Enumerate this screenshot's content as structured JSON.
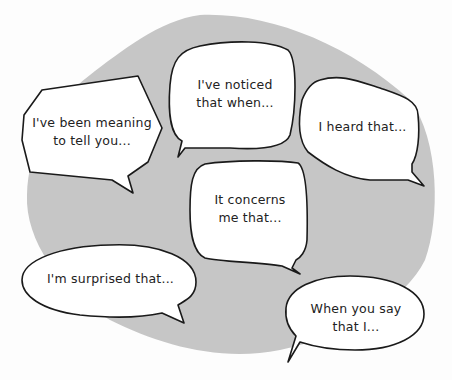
{
  "background": {
    "blob_color": "#c6c6c6",
    "page_color": "#fdfdfd",
    "outline_color": "#1a1a1a"
  },
  "bubbles": [
    {
      "id": "been-meaning",
      "text": "I've been meaning\nto tell you..."
    },
    {
      "id": "noticed",
      "text": "I've noticed\nthat when..."
    },
    {
      "id": "heard",
      "text": "I heard that..."
    },
    {
      "id": "concerns",
      "text": "It concerns\nme that..."
    },
    {
      "id": "surprised",
      "text": "I'm surprised that..."
    },
    {
      "id": "when-you-say",
      "text": "When you say\nthat I..."
    }
  ]
}
